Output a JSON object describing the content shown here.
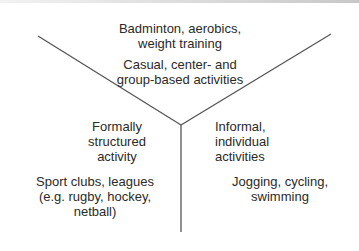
{
  "diagram": {
    "type": "Y-shaped three-segment diagram",
    "top": {
      "examples": [
        "Badminton, aerobics,",
        "weight training"
      ],
      "category": [
        "Casual, center- and",
        "group-based activities"
      ]
    },
    "left": {
      "category": [
        "Formally",
        "structured",
        "activity"
      ],
      "examples": [
        "Sport clubs, leagues",
        "(e.g. rugby, hockey,",
        "netball)"
      ]
    },
    "right": {
      "category": [
        "Informal,",
        "individual",
        "activities"
      ],
      "examples": [
        "Jogging, cycling,",
        "swimming"
      ]
    },
    "line_color": "#555555"
  }
}
